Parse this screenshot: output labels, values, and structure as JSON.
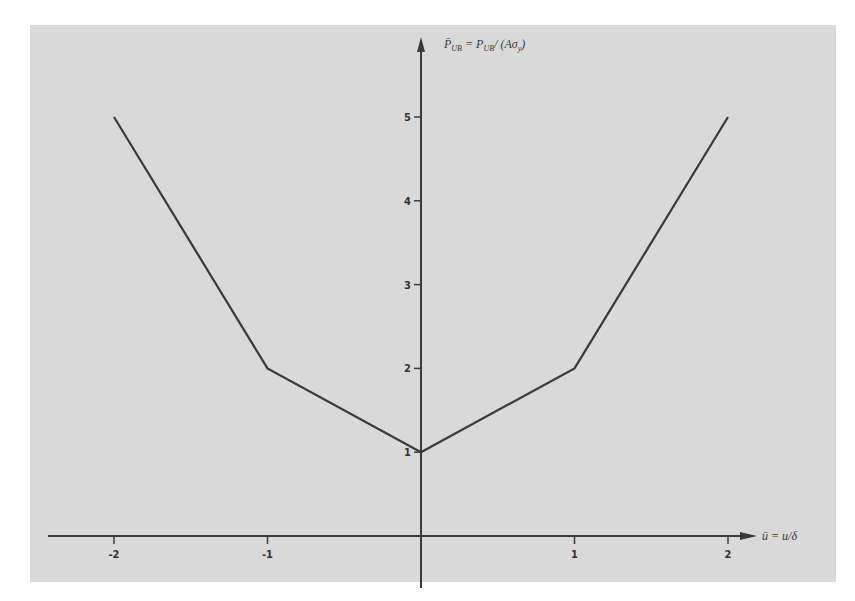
{
  "chart_data": {
    "type": "line",
    "title": "",
    "xlabel": "ū = u/δ",
    "ylabel": "P̄_UB = P_UB/(Aσ_y)",
    "x": [
      -2,
      -1,
      0,
      1,
      2
    ],
    "series": [
      {
        "name": "P̄_UB",
        "values": [
          5,
          2,
          1,
          2,
          5
        ]
      }
    ],
    "x_ticks": [
      "-2",
      "-1",
      "1",
      "2"
    ],
    "y_ticks": [
      "1",
      "2",
      "3",
      "4",
      "5"
    ],
    "xlim": [
      -2.5,
      2.2
    ],
    "ylim": [
      0,
      5.9
    ],
    "grid": false,
    "legend": "none"
  },
  "axes": {
    "x_label_main": "ū = u/δ",
    "y_label_main": "P̄",
    "y_label_sub": "UB",
    "y_label_eq": "= P",
    "y_label_sub2": "UB",
    "y_label_tail": "/ (Aσ",
    "y_label_sub3": "y",
    "y_label_close": ")"
  },
  "colors": {
    "background": "#d9d9d9",
    "line": "#3a3a3a",
    "axis": "#3a3a3a"
  }
}
